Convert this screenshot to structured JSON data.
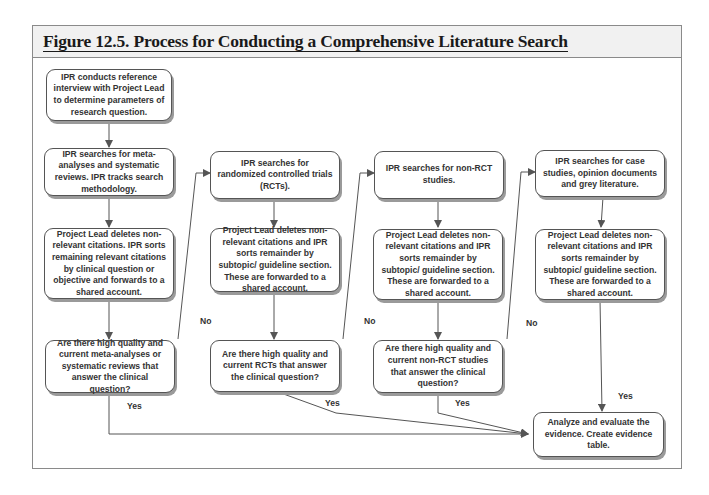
{
  "figure": {
    "title": "Figure 12.5.  Process for Conducting a Comprehensive Literature Search"
  },
  "nodes": {
    "interview": "IPR conducts reference interview with Project Lead to determine parameters of research question.",
    "col1_search": "IPR searches for meta-analyses and systematic reviews. IPR tracks search methodology.",
    "col1_sort": "Project Lead deletes non-relevant citations. IPR sorts remaining relevant citations by clinical question  or objective and forwards to a shared account.",
    "col1_decision": "Are there high quality and current meta-analyses or systematic reviews that answer the clinical question?",
    "col2_search": "IPR searches for randomized controlled trials (RCTs).",
    "col2_sort": "Project Lead deletes non-relevant citations and IPR sorts remainder by subtopic/ guideline section. These are forwarded to a shared account.",
    "col2_decision": "Are there high quality and current RCTs that answer the clinical question?",
    "col3_search": "IPR searches for non-RCT studies.",
    "col3_sort": "Project Lead deletes non-relevant citations and IPR sorts remainder by subtopic/ guideline section. These are forwarded to a shared account.",
    "col3_decision": "Are there high quality and current non-RCT studies that answer the clinical question?",
    "col4_search": "IPR searches for case studies, opinion documents and grey literature.",
    "col4_sort": "Project Lead deletes non-relevant citations and IPR sorts remainder by subtopic/ guideline section. These are forwarded to a shared account.",
    "final": "Analyze and evaluate the evidence. Create evidence table."
  },
  "labels": {
    "no1": "No",
    "no2": "No",
    "no3": "No",
    "yes1": "Yes",
    "yes2": "Yes",
    "yes3": "Yes",
    "yes4": "Yes"
  }
}
